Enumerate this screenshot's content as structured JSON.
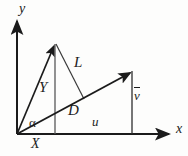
{
  "figure": {
    "type": "vector-decomposition-diagram",
    "background_color": "#fdfdfc",
    "stroke_color": "#1b1b1b",
    "width": 188,
    "height": 156
  },
  "axes": {
    "x_label": "x",
    "y_label": "y",
    "origin": [
      17,
      134
    ],
    "x_axis_end": [
      172,
      134
    ],
    "y_axis_end": [
      17,
      18
    ]
  },
  "vectors": [
    {
      "name": "Y",
      "label": "Y",
      "from": [
        17,
        134
      ],
      "to": [
        55,
        43
      ],
      "arrow": true
    },
    {
      "name": "D",
      "label": "D",
      "from": [
        17,
        134
      ],
      "to": [
        132,
        72
      ],
      "arrow": true
    }
  ],
  "segments": [
    {
      "name": "L",
      "label": "L",
      "from": [
        55,
        43
      ],
      "to": [
        83,
        98
      ],
      "arrow": false
    },
    {
      "name": "Y-vertical-drop",
      "label": "",
      "from": [
        55,
        43
      ],
      "to": [
        55,
        134
      ],
      "arrow": false
    },
    {
      "name": "v-bar-vertical",
      "label": "v̄",
      "from": [
        132,
        72
      ],
      "to": [
        132,
        134
      ],
      "arrow": false
    }
  ],
  "labels": {
    "axis_y": "y",
    "axis_x": "x",
    "vector_Y": "Y",
    "vector_D": "D",
    "segment_L": "L",
    "component_X": "X",
    "component_u": "u",
    "component_v": "v",
    "component_v_has_overbar": true,
    "angle_alpha": "α"
  },
  "angle": {
    "name": "alpha",
    "symbol": "α",
    "vertex": [
      17,
      134
    ],
    "between": [
      "x-axis",
      "D"
    ]
  }
}
